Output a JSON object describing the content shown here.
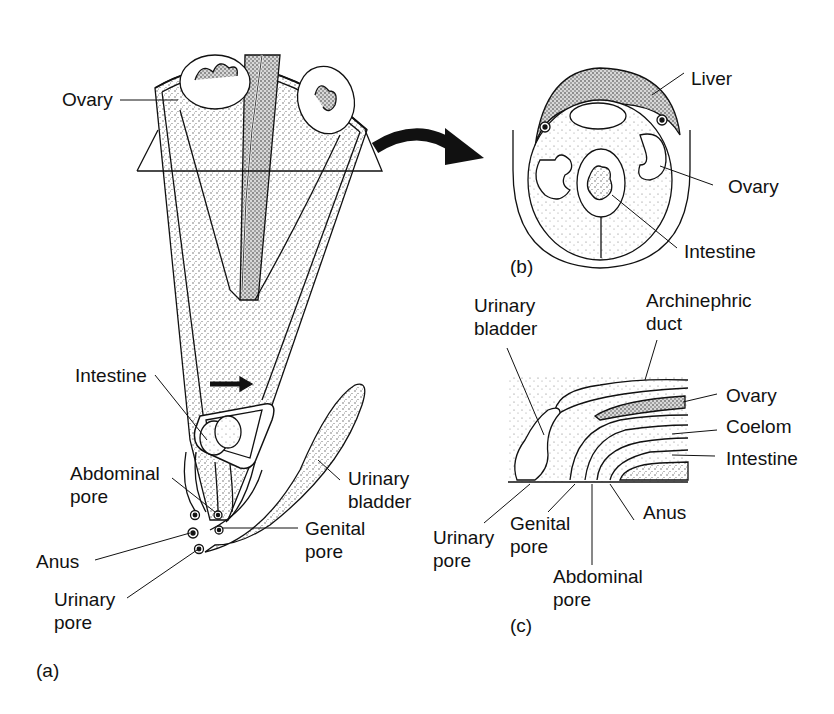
{
  "figure": {
    "panels": [
      {
        "id": "a",
        "panel_label": "(a)",
        "description": "Posterior body of female vertebrate, cut-away view",
        "labels": {
          "ovary": "Ovary",
          "intestine": "Intestine",
          "abdominal_pore_1": "Abdominal",
          "abdominal_pore_2": "pore",
          "urinary_bladder_1": "Urinary",
          "urinary_bladder_2": "bladder",
          "genital_pore_1": "Genital",
          "genital_pore_2": "pore",
          "anus": "Anus",
          "urinary_pore_1": "Urinary",
          "urinary_pore_2": "pore"
        }
      },
      {
        "id": "b",
        "panel_label": "(b)",
        "description": "Cross section",
        "labels": {
          "liver": "Liver",
          "ovary": "Ovary",
          "intestine": "Intestine"
        }
      },
      {
        "id": "c",
        "panel_label": "(c)",
        "description": "Sagittal section of cloacal region",
        "labels": {
          "urinary_bladder_1": "Urinary",
          "urinary_bladder_2": "bladder",
          "archinephric_duct_1": "Archinephric",
          "archinephric_duct_2": "duct",
          "ovary": "Ovary",
          "coelom": "Coelom",
          "intestine": "Intestine",
          "anus": "Anus",
          "urinary_pore_1": "Urinary",
          "urinary_pore_2": "pore",
          "genital_pore_1": "Genital",
          "genital_pore_2": "pore",
          "abdominal_pore_1": "Abdominal",
          "abdominal_pore_2": "pore"
        }
      }
    ],
    "colors": {
      "ink": "#111111",
      "stipple": "#9a9a9a",
      "background": "#ffffff"
    }
  }
}
